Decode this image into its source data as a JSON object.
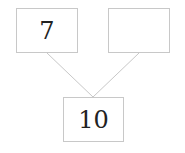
{
  "diagram": {
    "type": "number-bond",
    "boxes": {
      "left": {
        "value": "7"
      },
      "right": {
        "value": ""
      },
      "bottom": {
        "value": "10"
      }
    },
    "colors": {
      "border": "#c8c8c8",
      "line": "#c8c8c8",
      "text": "#222222"
    }
  }
}
